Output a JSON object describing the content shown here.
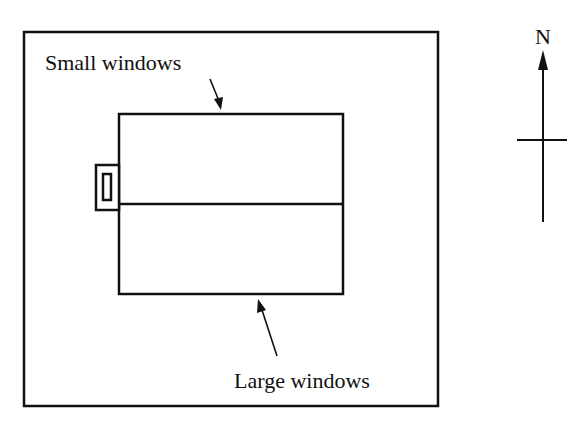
{
  "diagram": {
    "type": "floor-plan",
    "labels": {
      "small_windows": "Small windows",
      "large_windows": "Large windows",
      "north": "N"
    },
    "elements": {
      "site_boundary": "outer frame",
      "building": "rectangular building divided into north and south halves",
      "entrance": "small door box on west side",
      "compass": "north arrow"
    },
    "colors": {
      "line": "#111111",
      "background": "#ffffff"
    }
  }
}
